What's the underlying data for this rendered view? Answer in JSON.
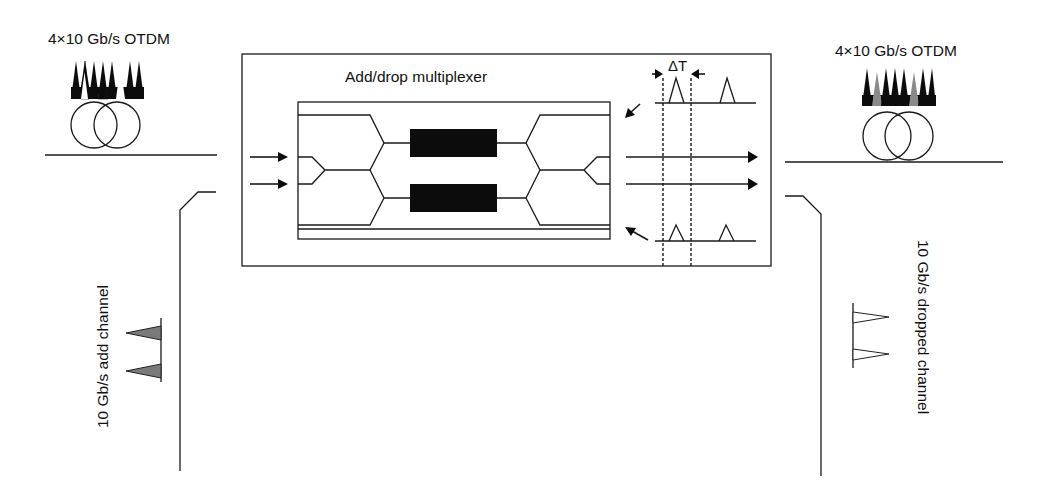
{
  "diagram": {
    "title": "Add/drop multiplexer",
    "input_signal": {
      "label": "4×10 Gb/s OTDM",
      "pulse_count": 8,
      "pulse_fills": [
        "#111111",
        "#111111",
        "#ffffff",
        "#111111",
        "#111111",
        "#111111",
        "#ffffff",
        "#111111"
      ],
      "note": "two time slots empty after drop"
    },
    "output_signal": {
      "label": "4×10 Gb/s OTDM",
      "pulse_count": 8,
      "pulse_fills": [
        "#111111",
        "#8a8a8a",
        "#111111",
        "#111111",
        "#111111",
        "#8a8a8a",
        "#111111",
        "#111111"
      ],
      "note": "added channel pulses shown in grey"
    },
    "add_channel": {
      "label": "10 Gb/s add channel",
      "pulse_count": 2,
      "pulse_fill": "#7a7a7a"
    },
    "drop_channel": {
      "label": "10 Gb/s dropped channel",
      "pulse_count": 2,
      "pulse_fill": "#ffffff"
    },
    "timing": {
      "label": "ΔT",
      "description": "switching window between dashed lines"
    },
    "components": {
      "fiber_coils": [
        "input fiber spool",
        "output fiber spool"
      ],
      "phase_modulators": 2,
      "interferometer": "Mach-Zehnder with input/output couplers"
    },
    "colors": {
      "line": "#1a1a1a",
      "added_pulse": "#8a8a8a",
      "background": "#ffffff"
    }
  }
}
